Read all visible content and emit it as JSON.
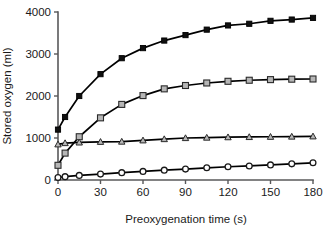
{
  "chart_data": {
    "type": "line",
    "title": "",
    "xlabel": "Preoxygenation time (s)",
    "ylabel": "Stored oxygen (ml)",
    "xlim": [
      0,
      180
    ],
    "ylim": [
      0,
      4000
    ],
    "xticks": [
      0,
      30,
      60,
      90,
      120,
      150,
      180
    ],
    "yticks": [
      0,
      1000,
      2000,
      3000,
      4000
    ],
    "xtick_labels": [
      "0",
      "30",
      "60",
      "90",
      "120",
      "150",
      "180"
    ],
    "ytick_labels": [
      "0",
      "1000",
      "2000",
      "3000",
      "4000"
    ],
    "grid": false,
    "legend": "none",
    "x": [
      0,
      5,
      15,
      30,
      45,
      60,
      75,
      90,
      105,
      120,
      135,
      150,
      165,
      180
    ],
    "series": [
      {
        "name": "total-stored-oxygen",
        "marker": "filled-square",
        "marker_color": "#101010",
        "line_color": "#000000",
        "values": [
          1200,
          1500,
          2000,
          2520,
          2900,
          3140,
          3320,
          3450,
          3580,
          3680,
          3720,
          3790,
          3820,
          3860
        ]
      },
      {
        "name": "lung-stored-oxygen",
        "marker": "open-square",
        "marker_color": "#b6b6b6",
        "line_color": "#000000",
        "values": [
          350,
          640,
          1030,
          1480,
          1800,
          2010,
          2170,
          2250,
          2310,
          2350,
          2375,
          2390,
          2400,
          2405
        ]
      },
      {
        "name": "blood-stored-oxygen",
        "marker": "triangle",
        "marker_color": "#b6b6b6",
        "line_color": "#000000",
        "values": [
          850,
          880,
          895,
          910,
          915,
          945,
          975,
          1000,
          1010,
          1020,
          1025,
          1030,
          1035,
          1040
        ]
      },
      {
        "name": "tissue-stored-oxygen",
        "marker": "open-circle",
        "marker_color": "#ffffff",
        "line_color": "#000000",
        "values": [
          60,
          80,
          110,
          140,
          175,
          205,
          235,
          260,
          290,
          315,
          335,
          360,
          385,
          410
        ]
      }
    ]
  }
}
